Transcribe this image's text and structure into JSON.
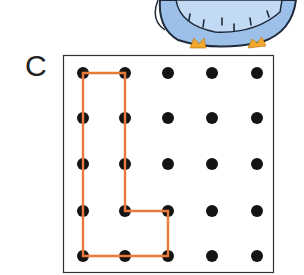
{
  "figure": {
    "label": "C",
    "grid": {
      "rows": 5,
      "cols": 5,
      "x_positions": [
        83,
        125,
        168,
        212,
        257
      ],
      "y_positions": [
        73,
        118,
        164,
        211,
        256
      ],
      "dot_color": "#141414",
      "dot_radius": 6
    },
    "shape": {
      "name": "L-shape",
      "stroke_color": "#ea7a3c",
      "vertices_grid": [
        [
          0,
          0
        ],
        [
          1,
          0
        ],
        [
          1,
          3
        ],
        [
          2,
          3
        ],
        [
          2,
          4
        ],
        [
          0,
          4
        ]
      ]
    },
    "frame": {
      "x": 63,
      "y": 55,
      "width": 211,
      "height": 218,
      "stroke": "#333333"
    },
    "decoration": {
      "name": "blue owl (partial)",
      "body_color": "#8fb6e0",
      "feet_color": "#f0a830"
    }
  }
}
